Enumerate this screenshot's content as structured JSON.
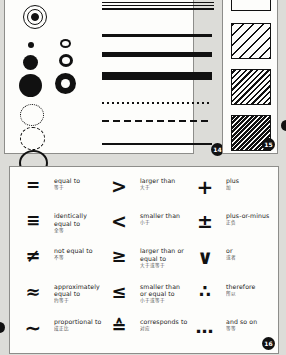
{
  "document": {
    "kind": "scanned-reference-page",
    "background_color": "#dcdcd8",
    "paper_color": "#fdfdfb",
    "ink_color": "#111111"
  },
  "plates": [
    {
      "id": "circles",
      "page_number": "",
      "groups": [
        {
          "name": "concentric-target",
          "items": [
            "triple-ring-with-solid-core"
          ]
        },
        {
          "name": "solid-dots",
          "items": [
            "small-solid-dot",
            "medium-solid-dot",
            "large-solid-dot"
          ]
        },
        {
          "name": "donuts",
          "items": [
            "small-open-circle",
            "medium-donut",
            "large-donut"
          ]
        },
        {
          "name": "outline-circles",
          "items": [
            "dotted-circle",
            "dashed-circle",
            "solid-circle"
          ]
        }
      ]
    },
    {
      "id": "lines",
      "page_number": "14",
      "items": [
        "hairline-pair",
        "hairline-single",
        "medium-rule",
        "thick-rule",
        "extra-thick-rule",
        "fine-dotted-rule",
        "dashed-rule",
        "thin-rule"
      ]
    },
    {
      "id": "hatching",
      "page_number": "15",
      "items": [
        "blank-square",
        "sparse-diagonal-hatch",
        "medium-diagonal-hatch",
        "dense-diagonal-hatch"
      ]
    }
  ],
  "symbols_plate": {
    "page_number": "16",
    "columns": [
      {
        "rows": [
          {
            "glyph": "=",
            "glyph_kind": "equals",
            "en": "equal to",
            "zh": "等于"
          },
          {
            "glyph": "≡",
            "glyph_kind": "identical",
            "en": "identically equal to",
            "zh": "全等"
          },
          {
            "glyph": "≠",
            "glyph_kind": "not-equal",
            "en": "not equal to",
            "zh": "不等"
          },
          {
            "glyph": "≈",
            "glyph_kind": "approx-equal",
            "en": "approximately equal to",
            "zh": "约等于"
          },
          {
            "glyph": "∼",
            "glyph_kind": "proportional",
            "en": "proportional to",
            "zh": "成正比"
          }
        ]
      },
      {
        "rows": [
          {
            "glyph": ">",
            "glyph_kind": "greater-than",
            "en": "larger than",
            "zh": "大于"
          },
          {
            "glyph": "<",
            "glyph_kind": "less-than",
            "en": "smaller than",
            "zh": "小于"
          },
          {
            "glyph": "≥",
            "glyph_kind": "greater-or-equal",
            "en": "larger than or equal to",
            "zh": "大于或等于"
          },
          {
            "glyph": "≤",
            "glyph_kind": "less-or-equal",
            "en": "smaller than or equal to",
            "zh": "小于或等于"
          },
          {
            "glyph": "≙",
            "glyph_kind": "corresponds-to",
            "en": "corresponds to",
            "zh": "对应"
          }
        ]
      },
      {
        "rows": [
          {
            "glyph": "+",
            "glyph_kind": "plus",
            "en": "plus",
            "zh": "加"
          },
          {
            "glyph": "±",
            "glyph_kind": "plus-minus",
            "en": "plus-or-minus",
            "zh": "正负"
          },
          {
            "glyph": "∨",
            "glyph_kind": "logical-or",
            "en": "or",
            "zh": "或者"
          },
          {
            "glyph": "∴",
            "glyph_kind": "therefore",
            "en": "therefore",
            "zh": "所以"
          },
          {
            "glyph": "…",
            "glyph_kind": "ellipsis",
            "en": "and so on",
            "zh": "等等"
          }
        ]
      }
    ]
  }
}
